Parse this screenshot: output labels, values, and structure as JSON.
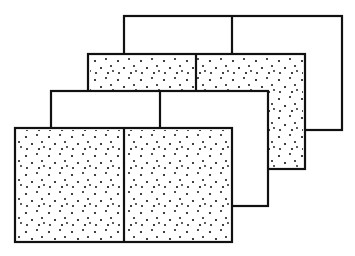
{
  "diagram": {
    "stroke_color": "#111111",
    "fill_color": "#ffffff",
    "dot_color": "#111111",
    "panels": [
      {
        "id": "panel-4-back",
        "x": 124,
        "y": 16,
        "w": 218,
        "h": 114,
        "divider_x": 232,
        "fill": "plain"
      },
      {
        "id": "panel-3",
        "x": 88,
        "y": 54,
        "w": 217,
        "h": 115,
        "divider_x": 196,
        "fill": "stippled"
      },
      {
        "id": "panel-2",
        "x": 51,
        "y": 91,
        "w": 217,
        "h": 115,
        "divider_x": 160,
        "fill": "plain"
      },
      {
        "id": "panel-1-front",
        "x": 15,
        "y": 128,
        "w": 217,
        "h": 114,
        "divider_x": 124,
        "fill": "stippled"
      }
    ]
  }
}
